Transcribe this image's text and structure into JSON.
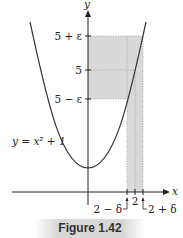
{
  "figure": {
    "caption": "Figure 1.42",
    "equation_label": "y = x² + 1",
    "axes": {
      "x_label": "x",
      "y_label": "y"
    },
    "y_ticks": [
      {
        "label": "5 + ε",
        "y": 36
      },
      {
        "label": "5",
        "y": 70
      },
      {
        "label": "5 − ε",
        "y": 99
      }
    ],
    "x_ticks": [
      {
        "label": "2 − δ",
        "x": 127
      },
      {
        "label": "2",
        "x": 135
      },
      {
        "label": "2 + δ",
        "x": 143
      }
    ],
    "colors": {
      "shade": "#d9d9d9",
      "curve": "#333333",
      "axis": "#222222",
      "caption_bg": "#d8d8d8"
    }
  }
}
